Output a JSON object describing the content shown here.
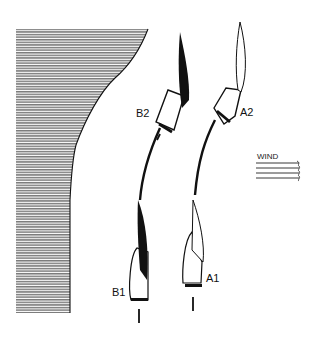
{
  "diagram": {
    "title": "",
    "labels": {
      "b2": "B2",
      "a2": "A2",
      "b1": "B1",
      "a1": "A1",
      "wind": "WIND"
    },
    "elements": {
      "shore": "shaded shoreline (land) on left",
      "boats": [
        {
          "id": "B1",
          "position": "lower left",
          "sail": "dark/black"
        },
        {
          "id": "A1",
          "position": "lower right",
          "sail": "white"
        },
        {
          "id": "B2",
          "position": "upper left",
          "sail": "dark/black"
        },
        {
          "id": "A2",
          "position": "upper right",
          "sail": "white"
        }
      ],
      "tracks": [
        "B1 to B2 curved path",
        "A1 to A2 curved path"
      ],
      "wind_direction": "from right (arrows pointing left-to-right lines)"
    },
    "colors": {
      "ink": "#111111",
      "shading": "#777777",
      "background": "#ffffff"
    }
  }
}
